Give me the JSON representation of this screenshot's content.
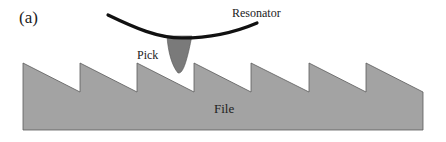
{
  "figure": {
    "panel_label": "(a)",
    "labels": {
      "resonator": "Resonator",
      "pick": "Pick",
      "file": "File"
    },
    "colors": {
      "file_fill": "#a3a3a3",
      "file_edge": "#5a5a5a",
      "pick_fill": "#7a7a7a",
      "resonator_stroke": "#111111",
      "text": "#222222"
    },
    "file_teeth": {
      "count": 7,
      "peak_x": [
        23,
        80,
        137,
        194,
        251,
        309,
        366
      ],
      "peak_y": 63,
      "valley_y": 92,
      "right_edge_x": 423,
      "bottom_y": 130
    }
  }
}
